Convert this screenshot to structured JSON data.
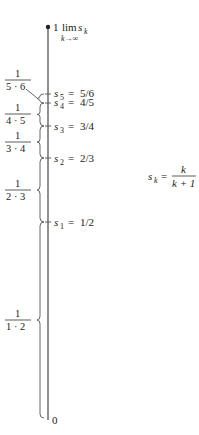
{
  "diagram": {
    "axis": {
      "top_label": "1",
      "bottom_label": "0",
      "limit_label": {
        "op": "lim",
        "var": "s",
        "sub": "k",
        "under": "k→∞"
      }
    },
    "points": [
      {
        "name": "s",
        "sub": "5",
        "value": "5/6"
      },
      {
        "name": "s",
        "sub": "4",
        "value": "4/5"
      },
      {
        "name": "s",
        "sub": "3",
        "value": "3/4"
      },
      {
        "name": "s",
        "sub": "2",
        "value": "2/3"
      },
      {
        "name": "s",
        "sub": "1",
        "value": "1/2"
      }
    ],
    "increments": [
      {
        "num": "1",
        "den": "5 · 6"
      },
      {
        "num": "1",
        "den": "4 · 5"
      },
      {
        "num": "1",
        "den": "3 · 4"
      },
      {
        "num": "1",
        "den": "2 · 3"
      },
      {
        "num": "1",
        "den": "1 · 2"
      }
    ],
    "formula": {
      "lhs_var": "s",
      "lhs_sub": "k",
      "eq": "=",
      "num": "k",
      "den": "k + 1"
    },
    "colors": {
      "line": "#555555",
      "text": "#222222",
      "background": "#ffffff"
    }
  }
}
